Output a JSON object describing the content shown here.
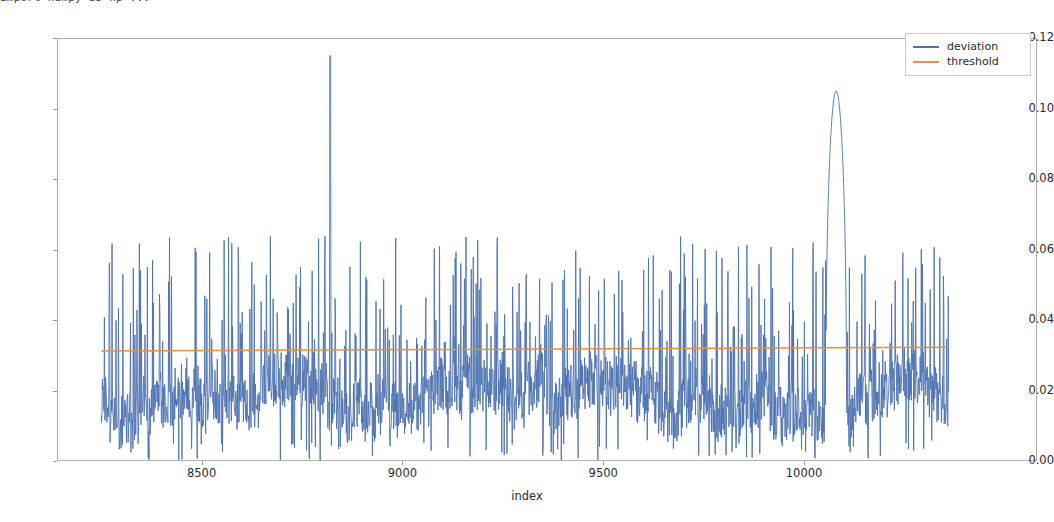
{
  "top_sliver_text": "import numpy as np                    ...",
  "axis": {
    "ylabel": "",
    "xlabel": "index",
    "yticks": [
      "0.00",
      "0.02",
      "0.04",
      "0.06",
      "0.08",
      "0.10",
      "0.12"
    ],
    "xticks": [
      "8500",
      "9000",
      "9500",
      "10000"
    ]
  },
  "legend": {
    "items": [
      {
        "label": "deviation",
        "color": "#4c72b0"
      },
      {
        "label": "threshold",
        "color": "#e8913a"
      }
    ]
  },
  "chart_data": {
    "type": "line",
    "title": "",
    "xlabel": "index",
    "ylabel": "",
    "xlim": [
      8140,
      10580
    ],
    "ylim": [
      0.0,
      0.12
    ],
    "yticks": [
      0.0,
      0.02,
      0.04,
      0.06,
      0.08,
      0.1,
      0.12
    ],
    "xticks": [
      8500,
      9000,
      9500,
      10000
    ],
    "grid": false,
    "legend_position": "upper right",
    "series": [
      {
        "name": "deviation",
        "color": "#4c72b0",
        "x_start": 8250,
        "x_end": 10360,
        "n_points": 2110,
        "description": "Dense high-frequency noisy signal oscillating mostly between 0.000 and 0.055, with a baseline band around 0.010-0.025 and frequent narrow spikes to 0.040-0.060. Two anomalous excursions: a single-sample spike to 0.115 near index 8820 and a broad rounded plateau peaking at 0.105 spanning roughly index 10060-10100.",
        "baseline_low": 0.005,
        "baseline_high": 0.028,
        "typical_spike_height": 0.05,
        "max_spike_height": 0.064,
        "anomalies": [
          {
            "index": 8820,
            "value": 0.115,
            "shape": "narrow-single-sample"
          },
          {
            "index": 10080,
            "value": 0.105,
            "shape": "broad-rounded-plateau"
          }
        ]
      },
      {
        "name": "threshold",
        "color": "#e8913a",
        "x_start": 8250,
        "x_end": 10360,
        "values_at_ends": [
          0.0312,
          0.0323
        ],
        "description": "Nearly flat orange line with a very slight upward slope across the full index range."
      }
    ]
  }
}
